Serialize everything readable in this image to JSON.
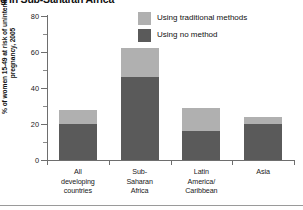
{
  "title": "g in Sub-Saharan Africa",
  "y_axis_title": "% of women 15-49 at risk of unintended pregnancy, 2005",
  "legend": {
    "items": [
      {
        "label": "Using traditional methods",
        "color": "#b0b0b0"
      },
      {
        "label": "Using no method",
        "color": "#5a5a5a"
      }
    ]
  },
  "colors": {
    "traditional": "#b0b0b0",
    "no_method": "#5a5a5a",
    "axis": "#6e6e6e"
  },
  "chart_data": {
    "type": "bar",
    "subtype": "stacked",
    "title": "g in Sub-Saharan Africa",
    "xlabel": "",
    "ylabel": "% of women 15-49 at risk of unintended pregnancy, 2005",
    "ylim": [
      0,
      80
    ],
    "ytick_labels": [
      "0",
      "20",
      "40",
      "60",
      "80"
    ],
    "ytick_values": [
      0,
      20,
      40,
      60,
      80
    ],
    "yminor_tick_values": [
      10,
      30,
      50,
      70
    ],
    "grid": false,
    "legend_position": "top-right",
    "categories": [
      "All developing countries",
      "Sub-Saharan Africa",
      "Latin America/ Caribbean",
      "Asia"
    ],
    "category_lines": [
      [
        "All",
        "developing",
        "countries"
      ],
      [
        "Sub-",
        "Saharan",
        "Africa"
      ],
      [
        "Latin",
        "America/",
        "Caribbean"
      ],
      [
        "Asia"
      ]
    ],
    "series": [
      {
        "name": "Using no method",
        "color": "#5a5a5a",
        "values": [
          20,
          46,
          16,
          20
        ]
      },
      {
        "name": "Using traditional methods",
        "color": "#b0b0b0",
        "values": [
          8,
          16,
          13,
          4
        ]
      }
    ],
    "totals": [
      28,
      62,
      29,
      24
    ]
  }
}
